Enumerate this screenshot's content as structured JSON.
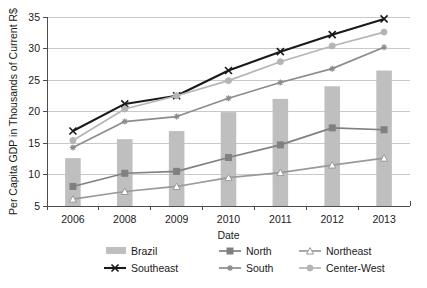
{
  "chart_data": {
    "type": "bar",
    "title": "",
    "xlabel": "Date",
    "ylabel": "Per Capita GDP in Thousands of Current R$",
    "categories": [
      "2006",
      "2008",
      "2009",
      "2010",
      "2011",
      "2012",
      "2013"
    ],
    "ylim": [
      5,
      35
    ],
    "ytick_step": 5,
    "yticks": [
      "5",
      "10",
      "15",
      "20",
      "25",
      "30",
      "35"
    ],
    "grid": true,
    "legend_position": "bottom",
    "series": [
      {
        "name": "Brazil",
        "kind": "bar",
        "marker": "bar-swatch",
        "color": "#bfbfbf",
        "values": [
          12.6,
          15.6,
          16.9,
          19.9,
          22.0,
          24.0,
          26.5
        ]
      },
      {
        "name": "North",
        "kind": "line",
        "marker": "square",
        "color": "#808080",
        "marker_fill": "#808080",
        "values": [
          8.1,
          10.2,
          10.5,
          12.7,
          14.7,
          17.4,
          17.1
        ]
      },
      {
        "name": "Northeast",
        "kind": "line",
        "marker": "triangle-open",
        "color": "#9a9a9a",
        "marker_fill": "#ffffff",
        "values": [
          6.1,
          7.3,
          8.1,
          9.5,
          10.3,
          11.5,
          12.6
        ]
      },
      {
        "name": "Southeast",
        "kind": "line",
        "marker": "cross",
        "color": "#1a1a1a",
        "marker_fill": "#1a1a1a",
        "values": [
          16.9,
          21.2,
          22.5,
          26.5,
          29.5,
          32.2,
          34.7
        ]
      },
      {
        "name": "South",
        "kind": "line",
        "marker": "asterisk",
        "color": "#8c8c8c",
        "marker_fill": "#8c8c8c",
        "values": [
          14.3,
          18.4,
          19.2,
          22.1,
          24.6,
          26.8,
          30.2
        ]
      },
      {
        "name": "Center-West",
        "kind": "line",
        "marker": "circle",
        "color": "#b5b5b5",
        "marker_fill": "#b5b5b5",
        "values": [
          15.4,
          20.4,
          22.5,
          24.9,
          27.9,
          30.4,
          32.6
        ]
      }
    ]
  },
  "legend": {
    "entries": [
      {
        "label": "Brazil"
      },
      {
        "label": "North"
      },
      {
        "label": "Northeast"
      },
      {
        "label": "Southeast"
      },
      {
        "label": "South"
      },
      {
        "label": "Center-West"
      }
    ]
  }
}
